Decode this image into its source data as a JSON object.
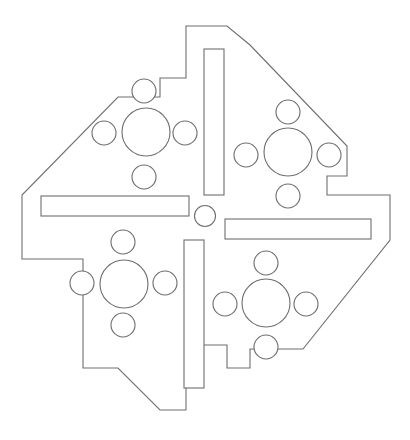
{
  "drawing": {
    "title": "Mechanical Plate Outline Drawing",
    "canvas": {
      "width": 410,
      "height": 440
    },
    "style": {
      "background_color": "#ffffff",
      "line_color": "#6e6e73",
      "fill_color": "#ffffff",
      "line_width": 1.1
    },
    "outline": {
      "name": "notched-octagonal-plate",
      "points": "186,26 227,26 227,45 250,45 347,146 347,176 327,176 327,195 390,195 390,240 303,349 250,349 250,368 227,368 227,345 186,345 186,410 160,410 120,368 83,368 83,259 83,259 22,259 22,195 118,97 160,97 160,78 186,78",
      "path": "M186,26 L227,26 L250,45 L347,146 L347,176 L327,176 L327,195 L390,195 L390,240 L303,349 L250,349 L250,368 L227,368 L227,345 L186,345 L186,410 L160,410 L118,368 L83,368 L83,259 L22,259 L22,195 L118,97 L160,97 L160,78 L186,78 Z"
    },
    "slots": [
      {
        "name": "slot-top-vertical",
        "x": 204,
        "y": 49,
        "width": 20,
        "height": 146
      },
      {
        "name": "slot-left-horizontal",
        "x": 41,
        "y": 196,
        "width": 148,
        "height": 20
      },
      {
        "name": "slot-right-horizontal",
        "x": 225,
        "y": 219,
        "width": 146,
        "height": 20
      },
      {
        "name": "slot-bottom-vertical",
        "x": 184,
        "y": 240,
        "width": 20,
        "height": 148
      }
    ],
    "center_hole": {
      "name": "hole-center",
      "cx": 205,
      "cy": 216,
      "r": 10.5
    },
    "hole_clusters": [
      {
        "name": "cluster-top-left",
        "main": {
          "name": "hole-main-top-left",
          "cx": 146,
          "cy": 132,
          "r": 24
        },
        "satellites": [
          {
            "name": "hole-top-left-north",
            "cx": 144,
            "cy": 91,
            "r": 12
          },
          {
            "name": "hole-top-left-west",
            "cx": 104,
            "cy": 133,
            "r": 12
          },
          {
            "name": "hole-top-left-east",
            "cx": 185,
            "cy": 133,
            "r": 12
          },
          {
            "name": "hole-top-left-south",
            "cx": 144,
            "cy": 177,
            "r": 12
          }
        ]
      },
      {
        "name": "cluster-top-right",
        "main": {
          "name": "hole-main-top-right",
          "cx": 288,
          "cy": 152,
          "r": 24
        },
        "satellites": [
          {
            "name": "hole-top-right-north",
            "cx": 288,
            "cy": 112,
            "r": 12
          },
          {
            "name": "hole-top-right-west",
            "cx": 246,
            "cy": 155,
            "r": 12
          },
          {
            "name": "hole-top-right-east",
            "cx": 329,
            "cy": 155,
            "r": 12
          },
          {
            "name": "hole-top-right-south",
            "cx": 288,
            "cy": 196,
            "r": 12
          }
        ]
      },
      {
        "name": "cluster-bottom-left",
        "main": {
          "name": "hole-main-bottom-left",
          "cx": 124,
          "cy": 284,
          "r": 24
        },
        "satellites": [
          {
            "name": "hole-bottom-left-north",
            "cx": 123,
            "cy": 242,
            "r": 12
          },
          {
            "name": "hole-bottom-left-west",
            "cx": 82,
            "cy": 283,
            "r": 12
          },
          {
            "name": "hole-bottom-left-east",
            "cx": 165,
            "cy": 283,
            "r": 12
          },
          {
            "name": "hole-bottom-left-south",
            "cx": 123,
            "cy": 325,
            "r": 12
          }
        ]
      },
      {
        "name": "cluster-bottom-right",
        "main": {
          "name": "hole-main-bottom-right",
          "cx": 266,
          "cy": 303,
          "r": 24
        },
        "satellites": [
          {
            "name": "hole-bottom-right-north",
            "cx": 266,
            "cy": 263,
            "r": 12
          },
          {
            "name": "hole-bottom-right-west",
            "cx": 225,
            "cy": 304,
            "r": 12
          },
          {
            "name": "hole-bottom-right-east",
            "cx": 306,
            "cy": 304,
            "r": 12
          },
          {
            "name": "hole-bottom-right-south",
            "cx": 266,
            "cy": 347,
            "r": 12
          }
        ]
      }
    ]
  }
}
